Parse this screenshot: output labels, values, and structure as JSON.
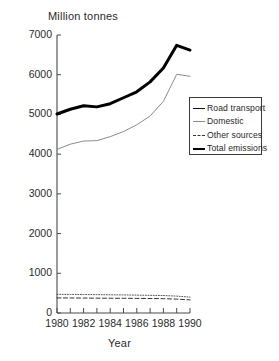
{
  "chart_data": {
    "type": "line",
    "title": "",
    "ylabel": "Million tonnes",
    "xlabel": "Year",
    "grid": false,
    "legend_position": "right-middle",
    "xlim": [
      1980,
      1990
    ],
    "ylim": [
      0,
      7000
    ],
    "y_ticks": [
      0,
      1000,
      2000,
      3000,
      4000,
      5000,
      6000,
      7000
    ],
    "y_tick_labels": [
      "0",
      "1000",
      "2000",
      "3000",
      "4000",
      "5000",
      "6000",
      "7000"
    ],
    "x_ticks": [
      1980,
      1981,
      1982,
      1983,
      1984,
      1985,
      1986,
      1987,
      1988,
      1989,
      1990
    ],
    "x_tick_labels": [
      "1980",
      "",
      "1982",
      "",
      "1984",
      "",
      "1986",
      "",
      "1988",
      "",
      "1990"
    ],
    "x": [
      1980,
      1981,
      1982,
      1983,
      1984,
      1985,
      1986,
      1987,
      1988,
      1989,
      1990
    ],
    "series": [
      {
        "name": "Road transport",
        "style": "dashed",
        "color": "#333333",
        "width": 1,
        "values": [
          380,
          378,
          376,
          374,
          372,
          370,
          368,
          365,
          360,
          350,
          330
        ]
      },
      {
        "name": "Domestic",
        "style": "solid-thin",
        "color": "#8c8c8c",
        "width": 1,
        "values": [
          4120,
          4250,
          4330,
          4340,
          4440,
          4570,
          4740,
          4960,
          5330,
          6010,
          5960
        ]
      },
      {
        "name": "Other sources",
        "style": "dotted",
        "color": "#555555",
        "width": 1,
        "values": [
          470,
          468,
          465,
          462,
          458,
          455,
          450,
          445,
          440,
          425,
          400
        ]
      },
      {
        "name": "Total emissions",
        "style": "thick-solid",
        "color": "#000000",
        "width": 3,
        "values": [
          5010,
          5130,
          5220,
          5190,
          5270,
          5420,
          5570,
          5820,
          6170,
          6740,
          6620
        ]
      }
    ]
  },
  "legend": {
    "items": [
      {
        "label": "Road transport",
        "swatch": "solid-thin"
      },
      {
        "label": "Domestic",
        "swatch": "solid-light"
      },
      {
        "label": "Other sources",
        "swatch": "dashed"
      },
      {
        "label": "Total emissions",
        "swatch": "thick"
      }
    ]
  }
}
